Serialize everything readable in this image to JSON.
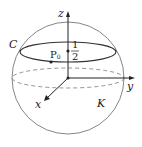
{
  "figure": {
    "type": "sphere-with-circle",
    "axes": {
      "x_label": "x",
      "y_label": "y",
      "z_label": "z"
    },
    "circle_label": "C",
    "sphere_label": "K",
    "point": {
      "label": "P",
      "subscript": "0"
    },
    "height_fraction": {
      "numerator": "1",
      "denominator": "2"
    },
    "colors": {
      "line": "#333333",
      "dash": "#777777",
      "sphere": "#555555"
    }
  }
}
